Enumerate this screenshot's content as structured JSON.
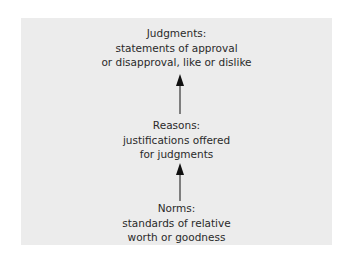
{
  "diagram": {
    "nodes": [
      {
        "id": "judgments",
        "title": "Judgments:",
        "lines": [
          "statements of approval",
          "or disapproval, like or dislike"
        ]
      },
      {
        "id": "reasons",
        "title": "Reasons:",
        "lines": [
          "justifications offered",
          "for judgments"
        ]
      },
      {
        "id": "norms",
        "title": "Norms:",
        "lines": [
          "standards of relative",
          "worth or goodness"
        ]
      }
    ],
    "edges": [
      {
        "from": "reasons",
        "to": "judgments"
      },
      {
        "from": "norms",
        "to": "reasons"
      }
    ],
    "colors": {
      "panel": "#ececec",
      "text": "#2a2a2a",
      "arrow": "#111111"
    }
  }
}
